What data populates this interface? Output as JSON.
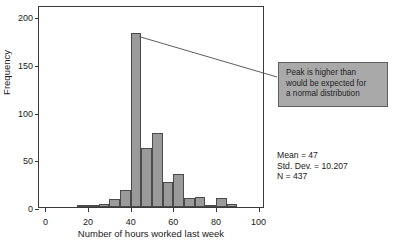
{
  "chart_data": {
    "type": "bar",
    "title": "",
    "subtitle": "",
    "xlabel": "Number of hours worked last week",
    "ylabel": "Frequency",
    "xlim": [
      -3,
      103
    ],
    "ylim": [
      0,
      212
    ],
    "grid": false,
    "legend_position": "none",
    "bin_width": 5,
    "xticks": [
      0,
      20,
      40,
      60,
      80,
      100
    ],
    "yticks": [
      0,
      50,
      100,
      150,
      200
    ],
    "bar_color": "#9a9a9a",
    "bar_edge_color": "#4a4a4a",
    "categories": [
      "0-5",
      "5-10",
      "10-15",
      "15-20",
      "20-25",
      "25-30",
      "30-35",
      "35-40",
      "40-45",
      "45-50",
      "50-55",
      "55-60",
      "60-65",
      "65-70",
      "70-75",
      "75-80",
      "80-85",
      "85-90",
      "90-95",
      "95-100"
    ],
    "bin_starts": [
      0,
      5,
      10,
      15,
      20,
      25,
      30,
      35,
      40,
      45,
      50,
      55,
      60,
      65,
      70,
      75,
      80,
      85,
      90,
      95
    ],
    "values": [
      0,
      0,
      0,
      1,
      2,
      3,
      8,
      18,
      183,
      62,
      78,
      26,
      35,
      9,
      11,
      2,
      9,
      3,
      0,
      0
    ],
    "annotations": [
      {
        "text_lines": [
          "Peak is higher than",
          "would be expected for",
          "a normal distribution"
        ],
        "points_to_bin": "40-45",
        "box_color": "#a9a9a9",
        "box_border_color": "#5e5e5e"
      }
    ],
    "stats": {
      "mean_label": "Mean = 47",
      "std_dev_label": "Std. Dev. = 10.207",
      "n_label": "N = 437",
      "mean": 47,
      "std_dev": 10.207,
      "n": 437
    }
  }
}
